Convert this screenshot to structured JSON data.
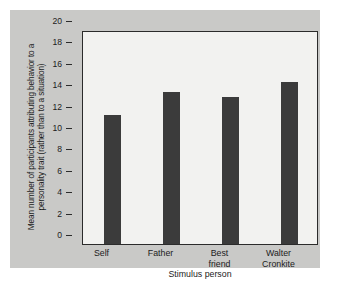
{
  "chart_data": {
    "type": "bar",
    "title": "",
    "subtitle": "",
    "categories": [
      "Self",
      "Father",
      "Best friend",
      "Walter Cronkite"
    ],
    "category_lines": [
      [
        "Self"
      ],
      [
        "Father"
      ],
      [
        "Best",
        "friend"
      ],
      [
        "Walter",
        "Cronkite"
      ]
    ],
    "values": [
      12.1,
      14.2,
      13.7,
      15.1
    ],
    "xlabel": "Stimulus person",
    "ylabel": "Mean number of participants attributing behavior to a personality trait (rather than to a situation)",
    "ylim": [
      0,
      20
    ],
    "yticks": [
      0,
      2,
      4,
      6,
      8,
      10,
      12,
      14,
      16,
      18,
      20
    ],
    "ytick_labels": [
      "0",
      "2",
      "4",
      "6",
      "8",
      "10",
      "12",
      "14",
      "16",
      "18",
      "20"
    ],
    "grid": false,
    "legend": null,
    "bar_color": "#3b3b3b",
    "plot_background": "#f2f2f0",
    "panel_background": "#c9c9c7",
    "axis_color": "#2b2b2b"
  }
}
